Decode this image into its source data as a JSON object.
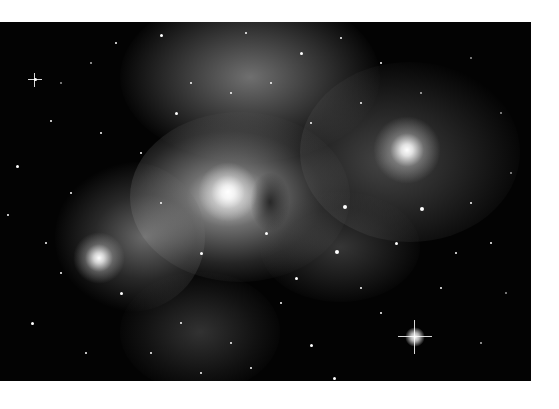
{
  "image": {
    "subject": "nebula-starfield",
    "description": "Grayscale astronomical photograph of a bright emission nebula with dense star field",
    "colors": {
      "page_background": "#ffffff",
      "space_background": "#030303",
      "nebula_highlight": "#e8e8e8",
      "star": "#ffffff"
    },
    "bright_stars": [
      {
        "name": "right-glow-star",
        "x": 407,
        "y": 150,
        "r": 34
      },
      {
        "name": "left-glow-star",
        "x": 99,
        "y": 258,
        "r": 26
      },
      {
        "name": "center-core",
        "x": 228,
        "y": 192,
        "r": 30
      },
      {
        "name": "bottom-spike-star",
        "x": 415,
        "y": 337,
        "r": 8
      }
    ]
  }
}
